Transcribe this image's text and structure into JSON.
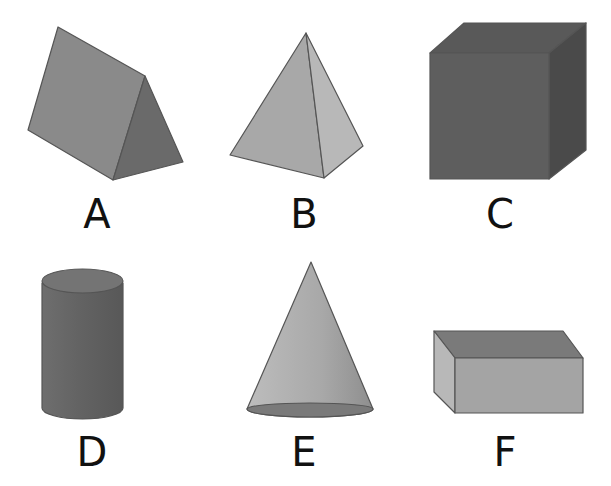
{
  "shapes": [
    {
      "label": "A",
      "name": "triangular prism"
    },
    {
      "label": "B",
      "name": "square pyramid"
    },
    {
      "label": "C",
      "name": "cube"
    },
    {
      "label": "D",
      "name": "cylinder"
    },
    {
      "label": "E",
      "name": "cone"
    },
    {
      "label": "F",
      "name": "rectangular prism"
    }
  ],
  "colors": {
    "background": "#ffffff",
    "dark": "#555555",
    "mid": "#7a7a7a",
    "light": "#a6a6a6",
    "lighter": "#bdbdbd"
  }
}
